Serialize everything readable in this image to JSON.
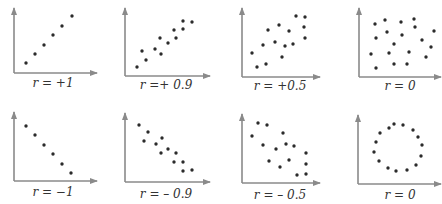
{
  "colors": {
    "axis": "#8a8a8a",
    "point": "#2b2b2b",
    "label": "#333333",
    "background": "#ffffff"
  },
  "chart_data": [
    {
      "type": "scatter",
      "title": "",
      "label": "r = +1",
      "r": 1,
      "axes": {
        "origin": [
          14,
          73
        ],
        "x_end": 97,
        "y_top": 8
      },
      "label_pos": [
        53,
        87
      ],
      "points": [
        [
          26,
          63
        ],
        [
          35,
          54
        ],
        [
          44,
          45
        ],
        [
          53,
          35
        ],
        [
          62,
          26
        ],
        [
          72,
          16
        ]
      ]
    },
    {
      "type": "scatter",
      "title": "",
      "label": "r =+ 0.9",
      "r": 0.9,
      "axes": {
        "origin": [
          125,
          76
        ],
        "x_end": 210,
        "y_top": 8
      },
      "label_pos": [
        166,
        89
      ],
      "points": [
        [
          137,
          67
        ],
        [
          146,
          60
        ],
        [
          142,
          51
        ],
        [
          155,
          49
        ],
        [
          161,
          54
        ],
        [
          160,
          38
        ],
        [
          168,
          43
        ],
        [
          176,
          38
        ],
        [
          174,
          30
        ],
        [
          183,
          29
        ],
        [
          183,
          21
        ],
        [
          192,
          22
        ]
      ]
    },
    {
      "type": "scatter",
      "title": "",
      "label": "r = +0.5",
      "r": 0.5,
      "axes": {
        "origin": [
          242,
          77
        ],
        "x_end": 320,
        "y_top": 8
      },
      "label_pos": [
        280,
        90
      ],
      "points": [
        [
          252,
          53
        ],
        [
          257,
          67
        ],
        [
          266,
          64
        ],
        [
          263,
          45
        ],
        [
          268,
          30
        ],
        [
          275,
          42
        ],
        [
          279,
          25
        ],
        [
          282,
          57
        ],
        [
          285,
          46
        ],
        [
          289,
          31
        ],
        [
          293,
          44
        ],
        [
          296,
          16
        ],
        [
          305,
          17
        ],
        [
          304,
          27
        ],
        [
          305,
          38
        ]
      ]
    },
    {
      "type": "scatter",
      "title": "",
      "label": "r = 0",
      "r": 0,
      "axes": {
        "origin": [
          359,
          77
        ],
        "x_end": 441,
        "y_top": 8
      },
      "label_pos": [
        400,
        90
      ],
      "points": [
        [
          375,
          24
        ],
        [
          385,
          20
        ],
        [
          401,
          22
        ],
        [
          414,
          19
        ],
        [
          376,
          38
        ],
        [
          387,
          32
        ],
        [
          402,
          35
        ],
        [
          415,
          27
        ],
        [
          434,
          31
        ],
        [
          394,
          44
        ],
        [
          422,
          40
        ],
        [
          431,
          47
        ],
        [
          371,
          54
        ],
        [
          389,
          53
        ],
        [
          409,
          52
        ],
        [
          426,
          57
        ],
        [
          376,
          68
        ],
        [
          394,
          64
        ],
        [
          407,
          64
        ]
      ]
    },
    {
      "type": "scatter",
      "title": "",
      "label": "r = −1",
      "r": -1,
      "axes": {
        "origin": [
          14,
          181
        ],
        "x_end": 97,
        "y_top": 112
      },
      "label_pos": [
        53,
        196
      ],
      "points": [
        [
          26,
          126
        ],
        [
          35,
          135
        ],
        [
          44,
          145
        ],
        [
          53,
          154
        ],
        [
          62,
          164
        ],
        [
          71,
          173
        ]
      ]
    },
    {
      "type": "scatter",
      "title": "",
      "label": "r = – 0.9",
      "r": -0.9,
      "axes": {
        "origin": [
          125,
          182
        ],
        "x_end": 210,
        "y_top": 113
      },
      "label_pos": [
        166,
        198
      ],
      "points": [
        [
          139,
          125
        ],
        [
          148,
          132
        ],
        [
          144,
          141
        ],
        [
          156,
          144
        ],
        [
          162,
          138
        ],
        [
          161,
          153
        ],
        [
          168,
          149
        ],
        [
          176,
          153
        ],
        [
          174,
          162
        ],
        [
          183,
          162
        ],
        [
          183,
          171
        ],
        [
          192,
          170
        ]
      ]
    },
    {
      "type": "scatter",
      "title": "",
      "label": "r = – 0.5",
      "r": -0.5,
      "axes": {
        "origin": [
          242,
          183
        ],
        "x_end": 320,
        "y_top": 114
      },
      "label_pos": [
        280,
        199
      ],
      "points": [
        [
          252,
          136
        ],
        [
          258,
          123
        ],
        [
          267,
          125
        ],
        [
          263,
          145
        ],
        [
          269,
          161
        ],
        [
          276,
          149
        ],
        [
          280,
          167
        ],
        [
          283,
          133
        ],
        [
          286,
          144
        ],
        [
          289,
          160
        ],
        [
          294,
          146
        ],
        [
          297,
          175
        ],
        [
          306,
          153
        ],
        [
          306,
          164
        ],
        [
          306,
          174
        ]
      ]
    },
    {
      "type": "scatter",
      "title": "",
      "label": "r = 0",
      "r": 0,
      "axes": {
        "origin": [
          358,
          184
        ],
        "x_end": 441,
        "y_top": 115
      },
      "label_pos": [
        400,
        199
      ],
      "points": [
        [
          394,
          124
        ],
        [
          403,
          125
        ],
        [
          389,
          128
        ],
        [
          413,
          130
        ],
        [
          380,
          133
        ],
        [
          418,
          137
        ],
        [
          376,
          142
        ],
        [
          422,
          145
        ],
        [
          374,
          152
        ],
        [
          421,
          156
        ],
        [
          379,
          161
        ],
        [
          416,
          165
        ],
        [
          388,
          168
        ],
        [
          396,
          171
        ],
        [
          407,
          170
        ]
      ]
    }
  ]
}
